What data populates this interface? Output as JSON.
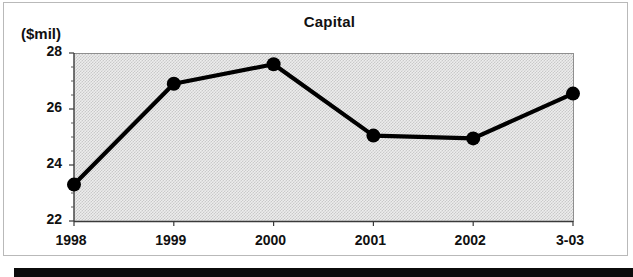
{
  "figure": {
    "title": "Capital",
    "y_units_label": "($mil)"
  },
  "chart_data": {
    "type": "line",
    "title": "Capital",
    "xlabel": "",
    "ylabel": "($mil)",
    "categories": [
      "1998",
      "1999",
      "2000",
      "2001",
      "2002",
      "3-03"
    ],
    "values": [
      23.3,
      26.9,
      27.6,
      25.05,
      24.95,
      26.55
    ],
    "series": [
      {
        "name": "Capital",
        "values": [
          23.3,
          26.9,
          27.6,
          25.05,
          24.95,
          26.55
        ]
      }
    ],
    "ylim": [
      22,
      28
    ],
    "y_ticks": [
      22,
      24,
      26,
      28
    ],
    "y_tick_labels": [
      "22",
      "24",
      "26",
      "28"
    ],
    "y_minor_tick_step": 0.5,
    "x_tick_labels": [
      "1998",
      "1999",
      "2000",
      "2001",
      "2002",
      "3-03"
    ],
    "grid": false,
    "legend": false,
    "legend_position": "none",
    "marker": "filled-circle",
    "plot_background": "#ededed"
  },
  "colors": {
    "line": "#000000",
    "marker": "#000000",
    "plot_bg": "#ededed",
    "axis": "#3a3a3a",
    "panel_border": "#b9b9b9",
    "text": "#111111",
    "bottom_bar": "#0b0b0b"
  }
}
